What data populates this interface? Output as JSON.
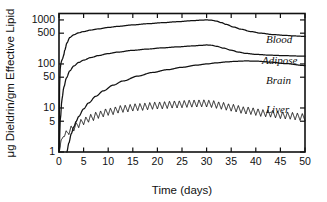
{
  "chart_data": {
    "type": "line",
    "title": "",
    "xlabel": "Time (days)",
    "ylabel": "μg Dieldrin/gm Effective Lipid",
    "yscale": "log",
    "xscale": "linear",
    "xlim": [
      0,
      50
    ],
    "ylim": [
      1,
      1400
    ],
    "grid": false,
    "legend_position": "inline-right",
    "xticks": [
      0,
      5,
      10,
      15,
      20,
      25,
      30,
      35,
      40,
      45,
      50
    ],
    "xtick_labels": [
      "0",
      "5",
      "10",
      "15",
      "20",
      "25",
      "30",
      "35",
      "40",
      "45",
      "50"
    ],
    "yticks": [
      1,
      5,
      10,
      50,
      100,
      500,
      1000
    ],
    "ytick_labels": [
      "1",
      "5",
      "10",
      "50",
      "100",
      "500",
      "1000"
    ],
    "series": [
      {
        "name": "Blood",
        "label": "Blood",
        "color": "#111111",
        "x": [
          0.0,
          0.15,
          0.3,
          0.5,
          0.7,
          0.9,
          1.2,
          1.6,
          2.2,
          3.0,
          4.0,
          5.0,
          6.5,
          8.0,
          10.0,
          12.0,
          15.0,
          18.0,
          21.0,
          24.0,
          27.0,
          29.0,
          30.0,
          31.0,
          32.0,
          33.0,
          34.0,
          35.5,
          37.0,
          39.0,
          41.0,
          43.5,
          46.0,
          48.0,
          50.0
        ],
        "y": [
          1.2,
          40,
          95,
          115,
          130,
          150,
          210,
          300,
          400,
          460,
          510,
          545,
          590,
          625,
          675,
          715,
          770,
          820,
          865,
          910,
          960,
          990,
          1000,
          985,
          940,
          870,
          790,
          690,
          615,
          545,
          500,
          465,
          445,
          432,
          422
        ]
      },
      {
        "name": "Adipose",
        "label": "Adipose",
        "color": "#111111",
        "x": [
          0.0,
          0.3,
          0.6,
          1.0,
          1.5,
          2.2,
          3.0,
          4.0,
          5.0,
          6.5,
          8.0,
          10.0,
          12.0,
          15.0,
          18.0,
          21.0,
          24.0,
          27.0,
          29.0,
          30.0,
          31.0,
          32.0,
          33.5,
          35.0,
          36.5,
          38.0,
          40.0,
          43.0,
          46.0,
          50.0
        ],
        "y": [
          1.0,
          6,
          16,
          30,
          48,
          70,
          90,
          108,
          122,
          140,
          155,
          172,
          186,
          204,
          218,
          232,
          244,
          256,
          265,
          270,
          266,
          252,
          228,
          205,
          186,
          174,
          165,
          158,
          154,
          150
        ]
      },
      {
        "name": "Brain",
        "label": "Brain",
        "color": "#111111",
        "x": [
          1.6,
          2.0,
          2.5,
          3.0,
          3.5,
          4.0,
          5.0,
          6.0,
          7.5,
          9.0,
          11.0,
          13.0,
          16.0,
          19.0,
          22.0,
          25.0,
          28.0,
          30.0,
          32.0,
          34.0,
          36.0,
          38.0,
          40.0,
          43.0,
          46.0,
          50.0
        ],
        "y": [
          1.0,
          1.6,
          2.6,
          3.7,
          5.0,
          6.4,
          9.5,
          13.0,
          18.5,
          24.5,
          33.0,
          41.0,
          53.0,
          64.0,
          74.0,
          84.0,
          94.0,
          100,
          106,
          111,
          115,
          117,
          116,
          110,
          102,
          92
        ]
      },
      {
        "name": "Liver",
        "label": "Liver",
        "color": "#111111",
        "description": "Oscillating daily dosing cycles; baseline rises from ~1 to plateau ~13 by day 25-30, then decays to ~6 by day 50.",
        "baseline_x": [
          0.0,
          0.5,
          1.0,
          1.5,
          2.0,
          3.0,
          4.0,
          5.0,
          6.5,
          8.0,
          10.0,
          13.0,
          16.0,
          20.0,
          24.0,
          27.0,
          29.5,
          31.0,
          33.0,
          35.0,
          38.0,
          42.0,
          46.0,
          50.0
        ],
        "baseline_y": [
          1.0,
          1.9,
          2.4,
          2.6,
          3.0,
          3.6,
          4.3,
          5.0,
          6.0,
          7.0,
          8.2,
          9.6,
          10.5,
          11.4,
          12.1,
          12.6,
          12.8,
          12.4,
          11.3,
          10.2,
          8.8,
          7.6,
          6.8,
          6.2
        ],
        "oscillation_period_days": 1.0,
        "oscillation_amplitude_ratio": 1.45,
        "peak_value": 15,
        "final_value": 6
      }
    ]
  },
  "axes": {
    "y_axis_title": "μg Dieldrin/gm Effective Lipid",
    "x_axis_title": "Time (days)"
  },
  "series_labels": {
    "blood": "Blood",
    "adipose": "Adipose",
    "brain": "Brain",
    "liver": "Liver"
  }
}
